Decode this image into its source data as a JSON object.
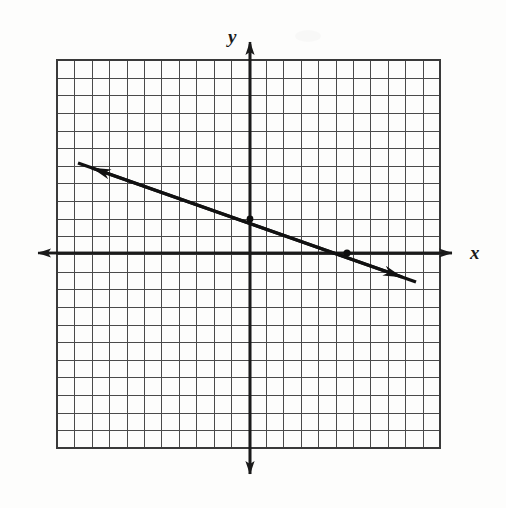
{
  "figure": {
    "kind": "coordinate-plane-line-graph",
    "background_color": "#fdfdfc",
    "ink_color": "#1a1a1a",
    "grid_color": "#555555",
    "axis_label_x": "x",
    "axis_label_y": "y"
  },
  "chart_data": {
    "type": "line",
    "title": "",
    "subtitle": "",
    "xlabel": "x",
    "ylabel": "y",
    "grid": true,
    "grid_step": 1,
    "legend": "none",
    "xlim": [
      -11,
      11
    ],
    "ylim": [
      -11,
      11
    ],
    "xticks": [
      -11,
      -10,
      -9,
      -8,
      -7,
      -6,
      -5,
      -4,
      -3,
      -2,
      -1,
      0,
      1,
      2,
      3,
      4,
      5,
      6,
      7,
      8,
      9,
      10,
      11
    ],
    "yticks": [
      -11,
      -10,
      -9,
      -8,
      -7,
      -6,
      -5,
      -4,
      -3,
      -2,
      -1,
      0,
      1,
      2,
      3,
      4,
      5,
      6,
      7,
      8,
      9,
      10,
      11
    ],
    "tick_labels_shown": false,
    "series": [
      {
        "name": "line",
        "kind": "straight-line",
        "double_arrow": true,
        "slope": -0.35,
        "y_intercept": 2,
        "x_intercept": 5.5,
        "equation": "y = -0.35x + 2",
        "endpoints": [
          {
            "x": -9.8,
            "y": 5.15
          },
          {
            "x": 9.4,
            "y": -1.6
          }
        ],
        "marked_points": [
          {
            "x": 0,
            "y": 2,
            "label": "y-intercept"
          },
          {
            "x": 5.5,
            "y": 0,
            "label": "x-intercept"
          }
        ]
      }
    ]
  },
  "geometry": {
    "grid": {
      "left": 57,
      "top": 60,
      "right": 440,
      "bottom": 448,
      "cols": 22,
      "rows": 22,
      "cell": 17.4
    },
    "origin": {
      "x": 250,
      "y": 253
    },
    "x_axis": {
      "x1": 25,
      "x2": 466,
      "y": 253
    },
    "y_axis": {
      "x": 250,
      "y1": 30,
      "y2": 486
    },
    "line": {
      "x1": 78,
      "y1": 163,
      "x2": 416,
      "y2": 282
    },
    "dots": [
      {
        "x": 250,
        "y": 219
      },
      {
        "x": 347,
        "y": 253
      }
    ],
    "label_y_pos": {
      "x": 228,
      "y": 27
    },
    "label_x_pos": {
      "x": 470,
      "y": 243
    }
  }
}
